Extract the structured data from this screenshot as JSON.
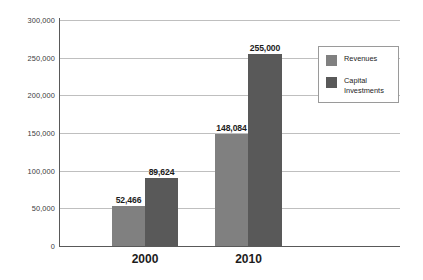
{
  "chart_data": {
    "type": "bar",
    "title": "",
    "subtitle": "",
    "xlabel": "",
    "ylabel": "",
    "categories": [
      "2000",
      "2010"
    ],
    "series": [
      {
        "name": "Revenues",
        "color": "#808080",
        "values": [
          52466,
          148084
        ],
        "labels": [
          "52,466",
          "148,084"
        ]
      },
      {
        "name": "Capital Investments",
        "color": "#595959",
        "values": [
          89624,
          255000
        ],
        "labels": [
          "89,624",
          "255,000"
        ]
      }
    ],
    "ylim": [
      0,
      300000
    ],
    "ytick_step": 50000,
    "ytick_labels": [
      "300,000",
      "250,000",
      "200,000",
      "150,000",
      "100,000",
      "50,000",
      "0"
    ],
    "ytick_values": [
      300000,
      250000,
      200000,
      150000,
      100000,
      50000,
      0
    ],
    "grid": true,
    "legend_position": "top-right",
    "legend_entries": [
      "Revenues",
      "Capital\nInvestments"
    ]
  }
}
